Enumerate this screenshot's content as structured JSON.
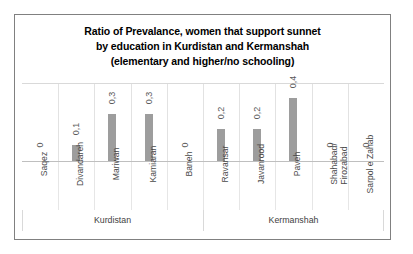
{
  "chart_data": {
    "type": "bar",
    "title_lines": [
      "Ratio of Prevalance, women that support sunnet",
      "by education in Kurdistan and Kermanshah",
      "(elementary and higher/no schooling)"
    ],
    "title": "Ratio of Prevalance, women that support sunnet by education in Kurdistan and Kermanshah (elementary and higher/no schooling)",
    "xlabel": "",
    "ylabel": "",
    "ylim": [
      0,
      0.5
    ],
    "grid": true,
    "legend": "none",
    "decimal_separator": ",",
    "bar_color": "#9d9d9d",
    "categories": [
      "Saqez",
      "Divandareh",
      "Mariwan",
      "Kamiaran",
      "Baneh",
      "Ravansar",
      "Javanrood",
      "Paveh",
      "Shahabad/ Firozabad",
      "Sarpol e Zahab"
    ],
    "category_lines": [
      [
        "Saqez"
      ],
      [
        "Divandareh"
      ],
      [
        "Mariwan"
      ],
      [
        "Kamiaran"
      ],
      [
        "Baneh"
      ],
      [
        "Ravansar"
      ],
      [
        "Javanrood"
      ],
      [
        "Paveh"
      ],
      [
        "Shahabad/",
        "Firozabad"
      ],
      [
        "Sarpol e Zahab"
      ]
    ],
    "values": [
      0,
      0.1,
      0.3,
      0.3,
      0,
      0.2,
      0.2,
      0.4,
      0,
      0
    ],
    "data_labels": [
      "0",
      "0,1",
      "0,3",
      "0,3",
      "0",
      "0,2",
      "0,2",
      "0,4",
      "0",
      "0"
    ],
    "groups": [
      {
        "label": "Kurdistan",
        "categories": [
          "Saqez",
          "Divandareh",
          "Mariwan",
          "Kamiaran",
          "Baneh"
        ]
      },
      {
        "label": "Kermanshah",
        "categories": [
          "Ravansar",
          "Javanrood",
          "Paveh",
          "Shahabad/ Firozabad",
          "Sarpol e Zahab"
        ]
      }
    ],
    "group_labels": [
      "Kurdistan",
      "Kermanshah"
    ]
  }
}
